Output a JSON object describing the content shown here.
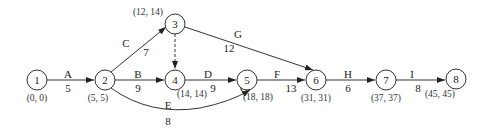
{
  "diagram": {
    "type": "activity-on-arrow network",
    "nodes": [
      {
        "id": "1",
        "label": "1",
        "x": 37,
        "y": 80,
        "times": "(0, 0)",
        "tx": 37,
        "ty": 101
      },
      {
        "id": "2",
        "label": "2",
        "x": 105,
        "y": 80,
        "times": "(5, 5)",
        "tx": 98,
        "ty": 101
      },
      {
        "id": "3",
        "label": "3",
        "x": 175,
        "y": 24,
        "times": "(12, 14)",
        "tx": 148,
        "ty": 15
      },
      {
        "id": "4",
        "label": "4",
        "x": 175,
        "y": 80,
        "times": "(14, 14)",
        "tx": 192,
        "ty": 97
      },
      {
        "id": "5",
        "label": "5",
        "x": 247,
        "y": 80,
        "times": "(18, 18)",
        "tx": 258,
        "ty": 100
      },
      {
        "id": "6",
        "label": "6",
        "x": 316,
        "y": 80,
        "times": "(31, 31)",
        "tx": 316,
        "ty": 101
      },
      {
        "id": "7",
        "label": "7",
        "x": 386,
        "y": 80,
        "times": "(37, 37)",
        "tx": 386,
        "ty": 101
      },
      {
        "id": "8",
        "label": "8",
        "x": 456,
        "y": 79,
        "times": "(45, 45)",
        "tx": 440,
        "ty": 97
      }
    ],
    "activities": [
      {
        "name": "A",
        "from": "1",
        "to": "2",
        "duration": "5"
      },
      {
        "name": "B",
        "from": "2",
        "to": "4",
        "duration": "9"
      },
      {
        "name": "C",
        "from": "2",
        "to": "3",
        "duration": "7"
      },
      {
        "name": "D",
        "from": "4",
        "to": "5",
        "duration": "9"
      },
      {
        "name": "E",
        "from": "2",
        "to": "5",
        "duration": "8"
      },
      {
        "name": "F",
        "from": "5",
        "to": "6",
        "duration": "13"
      },
      {
        "name": "G",
        "from": "3",
        "to": "6",
        "duration": "12"
      },
      {
        "name": "H",
        "from": "6",
        "to": "7",
        "duration": "6"
      },
      {
        "name": "I",
        "from": "7",
        "to": "8",
        "duration": "8"
      },
      {
        "name": "dummy",
        "from": "3",
        "to": "4",
        "duration": "",
        "style": "dashed"
      }
    ],
    "stray_label": "G"
  }
}
